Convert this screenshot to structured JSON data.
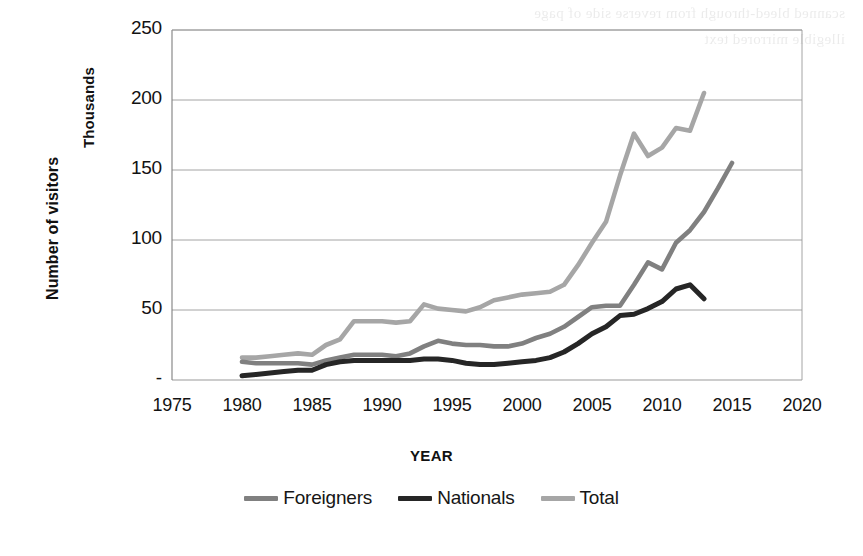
{
  "page": {
    "background_ghost_text": [
      "scanned bleed-through from reverse side of page",
      "illegible mirrored text"
    ]
  },
  "chart_data": {
    "type": "line",
    "title": "",
    "xlabel": "YEAR",
    "ylabel": "Number of visitors",
    "yunits": "Thousands",
    "xlim": [
      1975,
      2020
    ],
    "ylim": [
      0,
      250
    ],
    "xticks": [
      "1975",
      "1980",
      "1985",
      "1990",
      "1995",
      "2000",
      "2005",
      "2010",
      "2015",
      "2020"
    ],
    "xtick_values": [
      1975,
      1980,
      1985,
      1990,
      1995,
      2000,
      2005,
      2010,
      2015,
      2020
    ],
    "yticks": [
      "-",
      "50",
      "100",
      "150",
      "200",
      "250"
    ],
    "ytick_values": [
      0,
      50,
      100,
      150,
      200,
      250
    ],
    "grid": "horizontal",
    "legend_position": "bottom",
    "colors": {
      "foreigners": "#808080",
      "nationals": "#262626",
      "total": "#a6a6a6",
      "gridline": "#9a9a9a",
      "axis": "#7f7f7f"
    },
    "series": [
      {
        "name": "Foreigners",
        "color": "#808080",
        "x": [
          1980,
          1981,
          1982,
          1983,
          1984,
          1985,
          1986,
          1987,
          1988,
          1989,
          1990,
          1991,
          1992,
          1993,
          1994,
          1995,
          1996,
          1997,
          1998,
          1999,
          2000,
          2001,
          2002,
          2003,
          2004,
          2005,
          2006,
          2007,
          2008,
          2009,
          2010,
          2011,
          2012,
          2013,
          2014,
          2015
        ],
        "values": [
          13,
          12,
          12,
          12,
          12,
          11,
          14,
          16,
          18,
          18,
          18,
          17,
          19,
          24,
          28,
          26,
          25,
          25,
          24,
          24,
          26,
          30,
          33,
          38,
          45,
          52,
          53,
          53,
          68,
          84,
          79,
          98,
          107,
          120,
          137,
          155
        ]
      },
      {
        "name": "Nationals",
        "color": "#262626",
        "x": [
          1980,
          1981,
          1982,
          1983,
          1984,
          1985,
          1986,
          1987,
          1988,
          1989,
          1990,
          1991,
          1992,
          1993,
          1994,
          1995,
          1996,
          1997,
          1998,
          1999,
          2000,
          2001,
          2002,
          2003,
          2004,
          2005,
          2006,
          2007,
          2008,
          2009,
          2010,
          2011,
          2012,
          2013
        ],
        "values": [
          3,
          4,
          5,
          6,
          7,
          7,
          11,
          13,
          14,
          14,
          14,
          14,
          14,
          15,
          15,
          14,
          12,
          11,
          11,
          12,
          13,
          14,
          16,
          20,
          26,
          33,
          38,
          46,
          47,
          51,
          56,
          65,
          68,
          58
        ]
      },
      {
        "name": "Total",
        "color": "#a6a6a6",
        "x": [
          1980,
          1981,
          1982,
          1983,
          1984,
          1985,
          1986,
          1987,
          1988,
          1989,
          1990,
          1991,
          1992,
          1993,
          1994,
          1995,
          1996,
          1997,
          1998,
          1999,
          2000,
          2001,
          2002,
          2003,
          2004,
          2005,
          2006,
          2007,
          2008,
          2009,
          2010,
          2011,
          2012,
          2013
        ],
        "values": [
          16,
          16,
          17,
          18,
          19,
          18,
          25,
          29,
          42,
          42,
          42,
          41,
          42,
          54,
          51,
          50,
          49,
          52,
          57,
          59,
          61,
          62,
          63,
          68,
          82,
          98,
          113,
          146,
          176,
          160,
          166,
          180,
          178,
          205
        ]
      }
    ]
  },
  "legend": {
    "items": [
      {
        "label": "Foreigners",
        "color": "#808080"
      },
      {
        "label": "Nationals",
        "color": "#262626"
      },
      {
        "label": "Total",
        "color": "#a6a6a6"
      }
    ]
  }
}
